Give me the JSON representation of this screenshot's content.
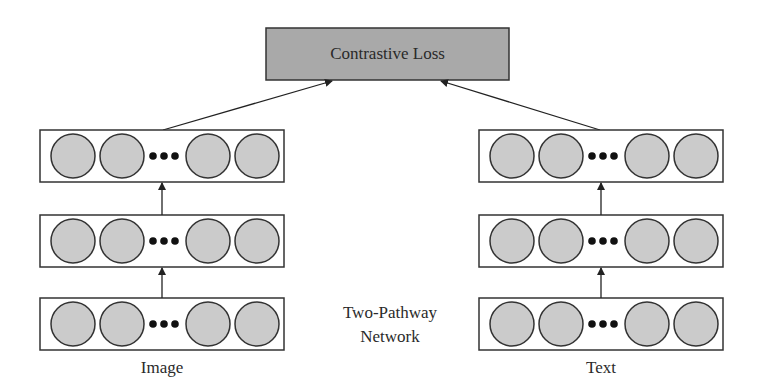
{
  "diagram": {
    "title_lines": [
      "Two-Pathway",
      "Network"
    ],
    "loss": {
      "label": "Contrastive Loss",
      "fill": "#a9a9a9"
    },
    "pathways": [
      {
        "name": "image",
        "label": "Image",
        "layers": 3,
        "units_per_layer_visible": 4,
        "ellipsis": "•••"
      },
      {
        "name": "text",
        "label": "Text",
        "layers": 3,
        "units_per_layer_visible": 4,
        "ellipsis": "•••"
      }
    ],
    "colors": {
      "unit_fill": "#cbcbcb",
      "stroke": "#333333",
      "background": "#ffffff"
    },
    "edges": [
      {
        "from": "image-layer-1",
        "to": "image-layer-2"
      },
      {
        "from": "image-layer-2",
        "to": "image-layer-3"
      },
      {
        "from": "image-layer-3",
        "to": "contrastive-loss"
      },
      {
        "from": "text-layer-1",
        "to": "text-layer-2"
      },
      {
        "from": "text-layer-2",
        "to": "text-layer-3"
      },
      {
        "from": "text-layer-3",
        "to": "contrastive-loss"
      }
    ]
  }
}
